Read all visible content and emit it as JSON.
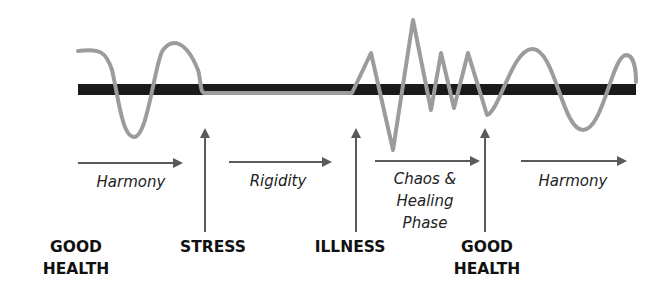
{
  "colors": {
    "baseline": "#1a1a1a",
    "wave": "#9c9c9c",
    "arrow": "#5a5a5a",
    "text": "#1a1a1a"
  },
  "phases": [
    {
      "id": "harmony-1",
      "lines": [
        "Harmony"
      ]
    },
    {
      "id": "rigidity",
      "lines": [
        "Rigidity"
      ]
    },
    {
      "id": "chaos-healing",
      "lines": [
        "Chaos &",
        "Healing",
        "Phase"
      ]
    },
    {
      "id": "harmony-2",
      "lines": [
        "Harmony"
      ]
    }
  ],
  "events": [
    {
      "id": "good-health-start",
      "lines": [
        "GOOD",
        "HEALTH"
      ]
    },
    {
      "id": "stress",
      "lines": [
        "STRESS"
      ]
    },
    {
      "id": "illness",
      "lines": [
        "ILLNESS"
      ]
    },
    {
      "id": "good-health-end",
      "lines": [
        "GOOD",
        "HEALTH"
      ]
    }
  ]
}
